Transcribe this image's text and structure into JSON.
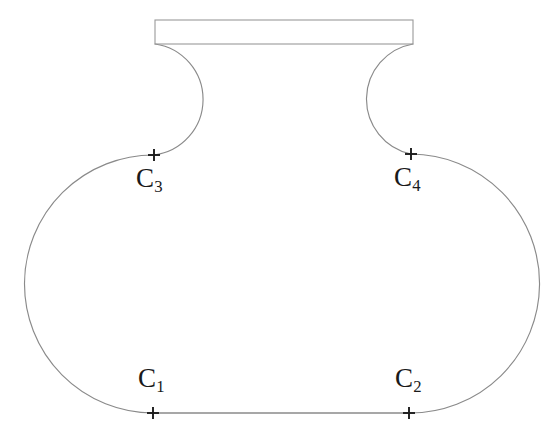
{
  "figure": {
    "type": "geometric-construction-diagram",
    "canvas": {
      "width": 559,
      "height": 438,
      "background": "#ffffff"
    },
    "stroke_colors": {
      "outline": "#8a8a8a",
      "rim": "#9a9a9a",
      "base_line": "#8a8a8a",
      "cross_mark": "#1c1c1c",
      "label_text": "#1a1a1a"
    },
    "rim": {
      "shape": "rectangle",
      "x": 155,
      "y": 20,
      "width": 258,
      "height": 24,
      "filled": false
    },
    "base_line": {
      "x1": 153,
      "y1": 413,
      "x2": 409,
      "y2": 413
    },
    "points": [
      {
        "id": "C1",
        "label": "C",
        "subscript": "1",
        "x": 153,
        "y": 413,
        "label_x": 138,
        "label_y": 365,
        "role": "lower-left-arc-center",
        "arc_radius": 129
      },
      {
        "id": "C2",
        "label": "C",
        "subscript": "2",
        "x": 409,
        "y": 413,
        "label_x": 395,
        "label_y": 365,
        "role": "lower-right-arc-center",
        "arc_radius": 129
      },
      {
        "id": "C3",
        "label": "C",
        "subscript": "3",
        "x": 154,
        "y": 155,
        "label_x": 136,
        "label_y": 165,
        "role": "upper-left-neck-arc-center",
        "arc_radius": 56
      },
      {
        "id": "C4",
        "label": "C",
        "subscript": "4",
        "x": 411,
        "y": 154,
        "label_x": 394,
        "label_y": 164,
        "role": "upper-right-neck-arc-center",
        "arc_radius": 56
      }
    ],
    "cross_mark": {
      "arm_length": 6
    },
    "outline_path": "M 155 44 A 56 56 0 0 1 154 155 A 129 129 0 1 0 153 413 L 409 413 A 129 129 0 1 0 411 154 A 56 56 0 0 1 413 44"
  }
}
